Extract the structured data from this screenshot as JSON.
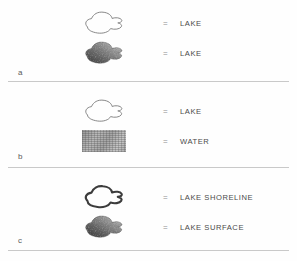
{
  "figure": {
    "caption_letters": [
      "a",
      "b",
      "c"
    ],
    "equals_symbol": "=",
    "panels": [
      {
        "letter": "a",
        "rows": [
          {
            "symbol": "lake-outline-thin",
            "equals": "=",
            "label": "LAKE"
          },
          {
            "symbol": "lake-filled-shaded",
            "equals": "=",
            "label": "LAKE"
          }
        ]
      },
      {
        "letter": "b",
        "rows": [
          {
            "symbol": "lake-outline-thin",
            "equals": "=",
            "label": "LAKE"
          },
          {
            "symbol": "water-texture-swatch",
            "equals": "=",
            "label": "WATER"
          }
        ]
      },
      {
        "letter": "c",
        "rows": [
          {
            "symbol": "lake-outline-thick",
            "equals": "=",
            "label": "LAKE SHORELINE"
          },
          {
            "symbol": "lake-filled-shaded",
            "equals": "=",
            "label": "LAKE SURFACE"
          }
        ]
      }
    ]
  },
  "colors": {
    "background": "#fefefe",
    "divider": "#c9c9c9",
    "label_text": "#4a4a4a",
    "letter_text": "#5a5a5a",
    "equals_text": "#8d8d8d",
    "outline_thin": "#7a7a7a",
    "outline_thick": "#3c3c3c",
    "fill_shade_dark": "#4e4e4e",
    "fill_shade_light": "#c6c6c6"
  }
}
